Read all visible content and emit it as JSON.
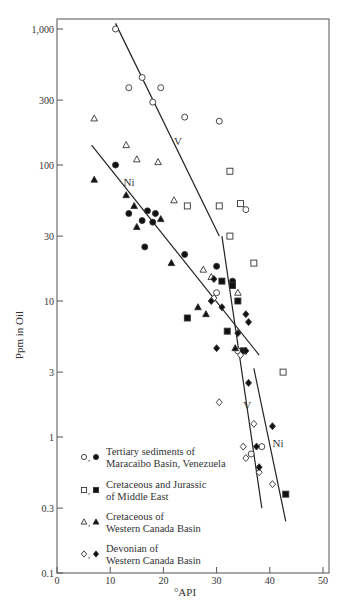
{
  "chart_data": {
    "type": "scatter",
    "title": "",
    "xlabel": "°API",
    "ylabel": "Ppm in Oil",
    "xlim": [
      0,
      50
    ],
    "ylim": [
      0.1,
      1000
    ],
    "yscale": "log",
    "grid": false,
    "x_ticks": [
      "0",
      "10",
      "20",
      "30",
      "40",
      "50"
    ],
    "y_ticks": [
      "0.1",
      "0.3",
      "1",
      "3",
      "10",
      "30",
      "100",
      "300",
      "1,000"
    ],
    "legend_position": "lower-left inside",
    "legend_note": "Open symbols = V, filled symbols = Ni",
    "series": [
      {
        "name": "Tertiary sediments of Maracaibo Basin, Venezuela",
        "legend_lines": [
          "Tertiary sediments of",
          "Maracaibo Basin, Venezuela"
        ],
        "marker": "circle",
        "V": [
          [
            11,
            1000
          ],
          [
            13.5,
            370
          ],
          [
            16,
            440
          ],
          [
            18,
            290
          ],
          [
            19.5,
            370
          ],
          [
            24,
            225
          ],
          [
            30.5,
            210
          ],
          [
            35.5,
            47
          ],
          [
            30,
            11.5
          ],
          [
            34,
            4.3
          ],
          [
            38.5,
            0.85
          ],
          [
            36.5,
            0.75
          ]
        ],
        "Ni": [
          [
            11,
            100
          ],
          [
            13.5,
            44
          ],
          [
            16,
            39
          ],
          [
            17,
            46
          ],
          [
            16.5,
            25
          ],
          [
            18.5,
            44
          ],
          [
            18,
            38
          ],
          [
            24,
            22
          ],
          [
            30,
            18
          ],
          [
            33,
            14
          ]
        ]
      },
      {
        "name": "Cretaceous and Jurassic of Middle East",
        "legend_lines": [
          "Cretaceous and Jurassic",
          "of Middle East"
        ],
        "marker": "square",
        "V": [
          [
            32.5,
            90
          ],
          [
            24.5,
            50
          ],
          [
            30.5,
            50
          ],
          [
            34.5,
            52
          ],
          [
            32.5,
            30
          ],
          [
            37,
            19
          ],
          [
            42.5,
            3
          ]
        ],
        "Ni": [
          [
            31,
            14
          ],
          [
            33,
            13
          ],
          [
            34,
            10
          ],
          [
            24.5,
            7.5
          ],
          [
            32,
            6
          ],
          [
            35,
            4.3
          ],
          [
            43,
            0.38
          ]
        ]
      },
      {
        "name": "Cretaceous of Western Canada Basin",
        "legend_lines": [
          "Cretaceous of",
          "Western Canada Basin"
        ],
        "marker": "triangle",
        "V": [
          [
            7,
            220
          ],
          [
            13,
            140
          ],
          [
            15,
            110
          ],
          [
            19,
            105
          ],
          [
            22,
            55
          ],
          [
            27.5,
            17
          ],
          [
            29,
            15
          ],
          [
            34,
            11.5
          ]
        ],
        "Ni": [
          [
            7,
            78
          ],
          [
            13,
            60
          ],
          [
            14.5,
            50
          ],
          [
            19.5,
            40
          ],
          [
            15,
            35
          ],
          [
            21.5,
            19
          ],
          [
            26.5,
            9
          ],
          [
            28,
            8
          ],
          [
            33.5,
            4.5
          ]
        ]
      },
      {
        "name": "Devonian of Western Canada Basin",
        "legend_lines": [
          "Devonian of",
          "Western Canada Basin"
        ],
        "marker": "diamond",
        "V": [
          [
            30.5,
            1.8
          ],
          [
            29.5,
            10.5
          ],
          [
            34.5,
            4
          ],
          [
            37,
            1.25
          ],
          [
            35,
            0.85
          ],
          [
            35.5,
            0.7
          ],
          [
            38,
            0.55
          ],
          [
            40.5,
            0.45
          ]
        ],
        "Ni": [
          [
            29.5,
            14.5
          ],
          [
            31,
            9
          ],
          [
            29,
            10
          ],
          [
            35.5,
            8
          ],
          [
            36,
            7
          ],
          [
            34,
            5.8
          ],
          [
            30,
            4.5
          ],
          [
            36,
            2.5
          ],
          [
            35.5,
            4.3
          ],
          [
            37.5,
            0.85
          ],
          [
            38,
            0.6
          ],
          [
            40.5,
            1.2
          ]
        ]
      }
    ],
    "trend_lines": [
      {
        "label": "V",
        "segment": "upper",
        "from": [
          11,
          1100
        ],
        "to": [
          30.5,
          30
        ]
      },
      {
        "label": "Ni",
        "segment": "upper",
        "from": [
          6.5,
          140
        ],
        "to": [
          38,
          4
        ]
      },
      {
        "label": "V",
        "segment": "lower",
        "from": [
          31,
          30
        ],
        "to": [
          38.5,
          0.3
        ]
      },
      {
        "label": "Ni",
        "segment": "lower",
        "from": [
          37,
          3.2
        ],
        "to": [
          43,
          0.24
        ]
      }
    ],
    "annotations": [
      {
        "text": "V",
        "x": 22,
        "y": 140
      },
      {
        "text": "Ni",
        "x": 12.5,
        "y": 70
      },
      {
        "text": "V",
        "x": 35,
        "y": 1.6
      },
      {
        "text": "Ni",
        "x": 40.5,
        "y": 0.85
      }
    ]
  }
}
